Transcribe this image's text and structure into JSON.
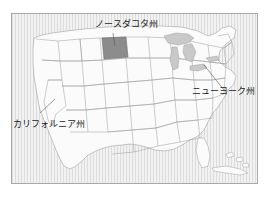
{
  "figure": {
    "type": "map",
    "title": "",
    "caption": "",
    "frame": {
      "border_color": "#a8a8a8",
      "background_color": "#f4f4f4"
    },
    "colors": {
      "land_fill": "#fbfbfb",
      "state_border": "#9a9a9a",
      "highlight_fill": "#8c8c8c",
      "water_fill": "#c9c9c9",
      "ocean_hatch": "#dedede",
      "label_text": "#1a1a1a",
      "leader_line": "#555555"
    }
  },
  "map": {
    "region": "United States",
    "labels": [
      {
        "id": "north-dakota",
        "text": "ノースダコタ州",
        "highlighted": true,
        "leader": true
      },
      {
        "id": "california",
        "text": "カリフォルニア州",
        "highlighted": false,
        "leader": true
      },
      {
        "id": "new-york",
        "text": "ニューヨーク州",
        "highlighted": false,
        "leader": true
      }
    ],
    "highlighted_state": "ノースダコタ州"
  }
}
